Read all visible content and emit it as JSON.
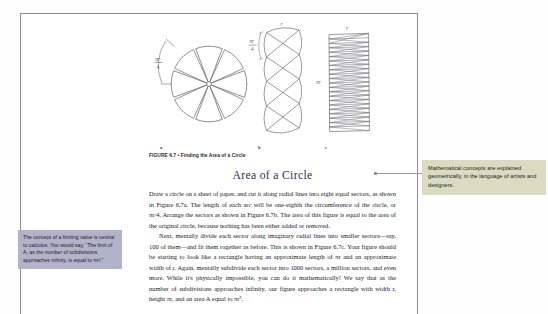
{
  "document": {
    "figure": {
      "caption": "FIGURE 6.7 • Finding the Area of a Circle",
      "panels": [
        {
          "label": "a",
          "name": "circle-divided-into-eight-sectors",
          "arc_label": "πr/4"
        },
        {
          "label": "b",
          "name": "sectors-arranged-zigzag",
          "arc_label": "πr/4",
          "top_label": "r",
          "side_label": "πr"
        },
        {
          "label": "c",
          "name": "sectors-subdivided-into-rectangle",
          "top_label": "r",
          "side_label": "πr"
        }
      ]
    },
    "section": {
      "heading": "Area of a Circle",
      "paragraphs": [
        "Draw a circle on a sheet of paper, and cut it along radial lines into eight equal sectors, as shown in Figure 6.7a. The length of each arc will be one-eighth the circumference of the circle, or πr/4. Arrange the sectors as shown in Figure 6.7b. The area of this figure is equal to the area of the original circle, because nothing has been either added or removed.",
        "Next, mentally divide each sector along imaginary radial lines into smaller sectors—say, 100 of them—and fit them together as before. This is shown in Figure 6.7c. Your figure should be starting to look like a rectangle having an approximate length of πr and an approximate width of r. Again, mentally subdivide each sector into 1000 sectors, a million sectors, and even more. While it's physically impossible, you can do it mathematically! We say that as the number of subdivisions approaches infinity, our figure approaches a rectangle with width r, height πr, and an area A equal to πr²."
      ]
    }
  },
  "annotations": {
    "left_callout": {
      "text": "The concept of a limiting value is central to calculus. You would say, “The limit of A, as the number of subdivisions approaches infinity, is equal to πr².”",
      "color": "#b3b2cb"
    },
    "right_callout": {
      "text": "Mathematical concepts are explained geometrically, in the language of artists and designers.",
      "color": "#d9dcc0"
    }
  }
}
